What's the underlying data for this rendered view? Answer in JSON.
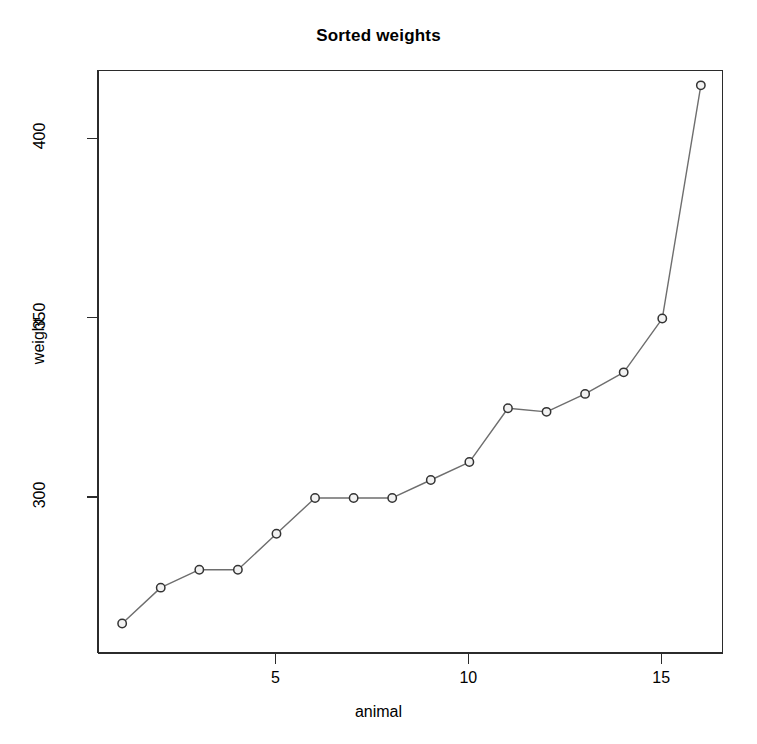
{
  "chart_data": {
    "type": "line",
    "title": "Sorted weights",
    "xlabel": "animal",
    "ylabel": "weight",
    "x": [
      1,
      2,
      3,
      4,
      5,
      6,
      7,
      8,
      9,
      10,
      11,
      12,
      13,
      14,
      15,
      16
    ],
    "values": [
      265,
      275,
      280,
      280,
      290,
      300,
      300,
      300,
      305,
      310,
      325,
      324,
      329,
      335,
      350,
      415
    ],
    "series": [
      {
        "name": "weight",
        "values": [
          265,
          275,
          280,
          280,
          290,
          300,
          300,
          300,
          305,
          310,
          325,
          324,
          329,
          335,
          350,
          415
        ]
      }
    ],
    "xlim": [
      0.4,
      16.6
    ],
    "ylim": [
      256.5,
      419.0
    ],
    "xticks": [
      5,
      10,
      15
    ],
    "xtick_labels": [
      "5",
      "10",
      "15"
    ],
    "yticks": [
      300,
      350,
      400
    ],
    "ytick_labels": [
      "300",
      "350",
      "400"
    ],
    "grid": false,
    "legend": false,
    "marker": "open-circle",
    "line_color": "#6e6e6e",
    "marker_edge_color": "#333333",
    "marker_face_color": "#f2f2f2",
    "axis_color": "#2b2b2b",
    "background_color": "#ffffff"
  }
}
